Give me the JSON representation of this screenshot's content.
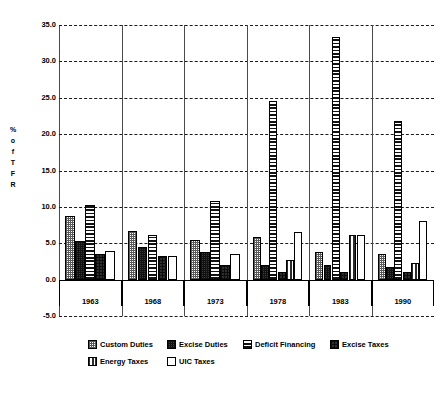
{
  "chart_data": {
    "type": "bar",
    "title": "",
    "subtitle": "",
    "xlabel": "",
    "ylabel": "% of TFR",
    "ylabel_letters": [
      "%",
      "o",
      "f",
      "T",
      "F",
      "R"
    ],
    "categories": [
      "1963",
      "1968",
      "1973",
      "1978",
      "1983",
      "1990"
    ],
    "ylim": [
      -5.0,
      35.0
    ],
    "ytick_labels": [
      "35.0",
      "30.0",
      "25.0",
      "20.0",
      "15.0",
      "10.0",
      "5.0",
      "0.0",
      "-5.0"
    ],
    "ytick_values": [
      35.0,
      30.0,
      25.0,
      20.0,
      15.0,
      10.0,
      5.0,
      0.0,
      -5.0
    ],
    "grid": true,
    "legend_position": "bottom",
    "series": [
      {
        "name": "Custom Duties",
        "pattern": "pat-checker-light",
        "values": [
          8.8,
          6.7,
          5.5,
          5.8,
          3.8,
          3.5
        ]
      },
      {
        "name": "Excise Duties",
        "pattern": "pat-checker-dark",
        "values": [
          5.3,
          4.5,
          3.8,
          2.0,
          2.0,
          1.8
        ]
      },
      {
        "name": "Deficit Financing",
        "pattern": "pat-hlines",
        "values": [
          10.3,
          6.2,
          10.8,
          24.5,
          33.3,
          21.8
        ]
      },
      {
        "name": "Excise Taxes",
        "pattern": "pat-solid-dark",
        "values": [
          3.5,
          3.2,
          2.0,
          1.0,
          1.0,
          1.0
        ]
      },
      {
        "name": "Energy Taxes",
        "pattern": "pat-vlines",
        "values": [
          null,
          null,
          null,
          2.7,
          6.2,
          2.3
        ]
      },
      {
        "name": "UIC Taxes",
        "pattern": "pat-white",
        "values": [
          4.0,
          3.3,
          3.5,
          6.5,
          6.2,
          8.0
        ]
      }
    ],
    "legend": [
      {
        "label": "Custom Duties",
        "pattern": "pat-checker-light"
      },
      {
        "label": "Excise Duties",
        "pattern": "pat-checker-dark"
      },
      {
        "label": "Deficit Financing",
        "pattern": "pat-hlines"
      },
      {
        "label": "Excise Taxes",
        "pattern": "pat-solid-dark"
      },
      {
        "label": "Energy Taxes",
        "pattern": "pat-vlines"
      },
      {
        "label": "UIC Taxes",
        "pattern": "pat-white"
      }
    ],
    "colors": {
      "axis": "#000000",
      "grid": "#1a1a1a",
      "frame": "#4a4a4a",
      "background": "#ffffff"
    }
  }
}
